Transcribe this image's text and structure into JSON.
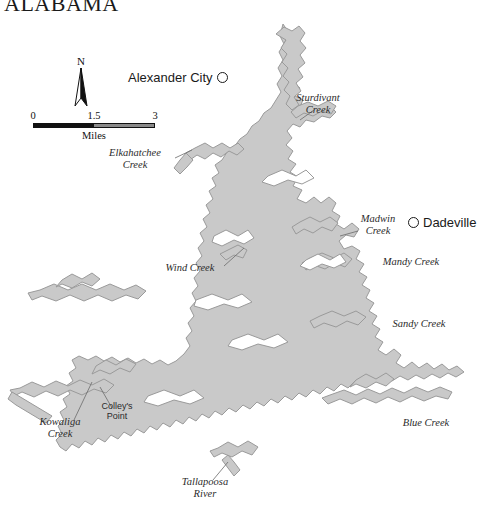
{
  "map": {
    "title": "ALABAMA",
    "background_color": "#ffffff",
    "water_fill_color": "#c9c9c9",
    "water_stroke_color": "#9a9a9a",
    "leader_line_color": "#6b6b6b",
    "width": 491,
    "height": 518
  },
  "cities": [
    {
      "name": "Alexander City",
      "marker": "open-circle",
      "x": 128,
      "y": 77,
      "marker_side": "right"
    },
    {
      "name": "Dadeville",
      "marker": "open-circle",
      "x": 408,
      "y": 222,
      "marker_side": "left"
    }
  ],
  "water_features": [
    {
      "name": "Sturdivant\nCreek",
      "x": 318,
      "y": 103,
      "leader": {
        "x1": 300,
        "y1": 120,
        "x2": 314,
        "y2": 110
      }
    },
    {
      "name": "Elkahatchee\nCreek",
      "x": 135,
      "y": 158,
      "leader": {
        "x1": 175,
        "y1": 158,
        "x2": 192,
        "y2": 150
      }
    },
    {
      "name": "Wind Creek",
      "x": 190,
      "y": 268,
      "leader": {
        "x1": 224,
        "y1": 266,
        "x2": 244,
        "y2": 248
      }
    },
    {
      "name": "Madwin\nCreek",
      "x": 378,
      "y": 224,
      "leader": {
        "x1": 358,
        "y1": 231,
        "x2": 340,
        "y2": 236
      }
    },
    {
      "name": "Mandy Creek",
      "x": 411,
      "y": 262,
      "leader": null
    },
    {
      "name": "Sandy Creek",
      "x": 419,
      "y": 324,
      "leader": null
    },
    {
      "name": "Blue Creek",
      "x": 426,
      "y": 423,
      "leader": null
    },
    {
      "name": "Kowaliga\nCreek",
      "x": 60,
      "y": 427,
      "leader": {
        "x1": 74,
        "y1": 420,
        "x2": 92,
        "y2": 382
      }
    },
    {
      "name": "Tallapoosa\nRiver",
      "x": 205,
      "y": 487,
      "leader": {
        "x1": 213,
        "y1": 480,
        "x2": 228,
        "y2": 462
      }
    }
  ],
  "points_of_interest": [
    {
      "name": "Colley's\nPoint",
      "x": 117,
      "y": 411,
      "leader": {
        "x1": 112,
        "y1": 408,
        "x2": 100,
        "y2": 387
      }
    }
  ],
  "north_arrow": {
    "label": "N"
  },
  "scale_bar": {
    "units": "Miles",
    "tick_labels": [
      "0",
      "1.5",
      "3"
    ],
    "min": 0,
    "max": 3
  }
}
